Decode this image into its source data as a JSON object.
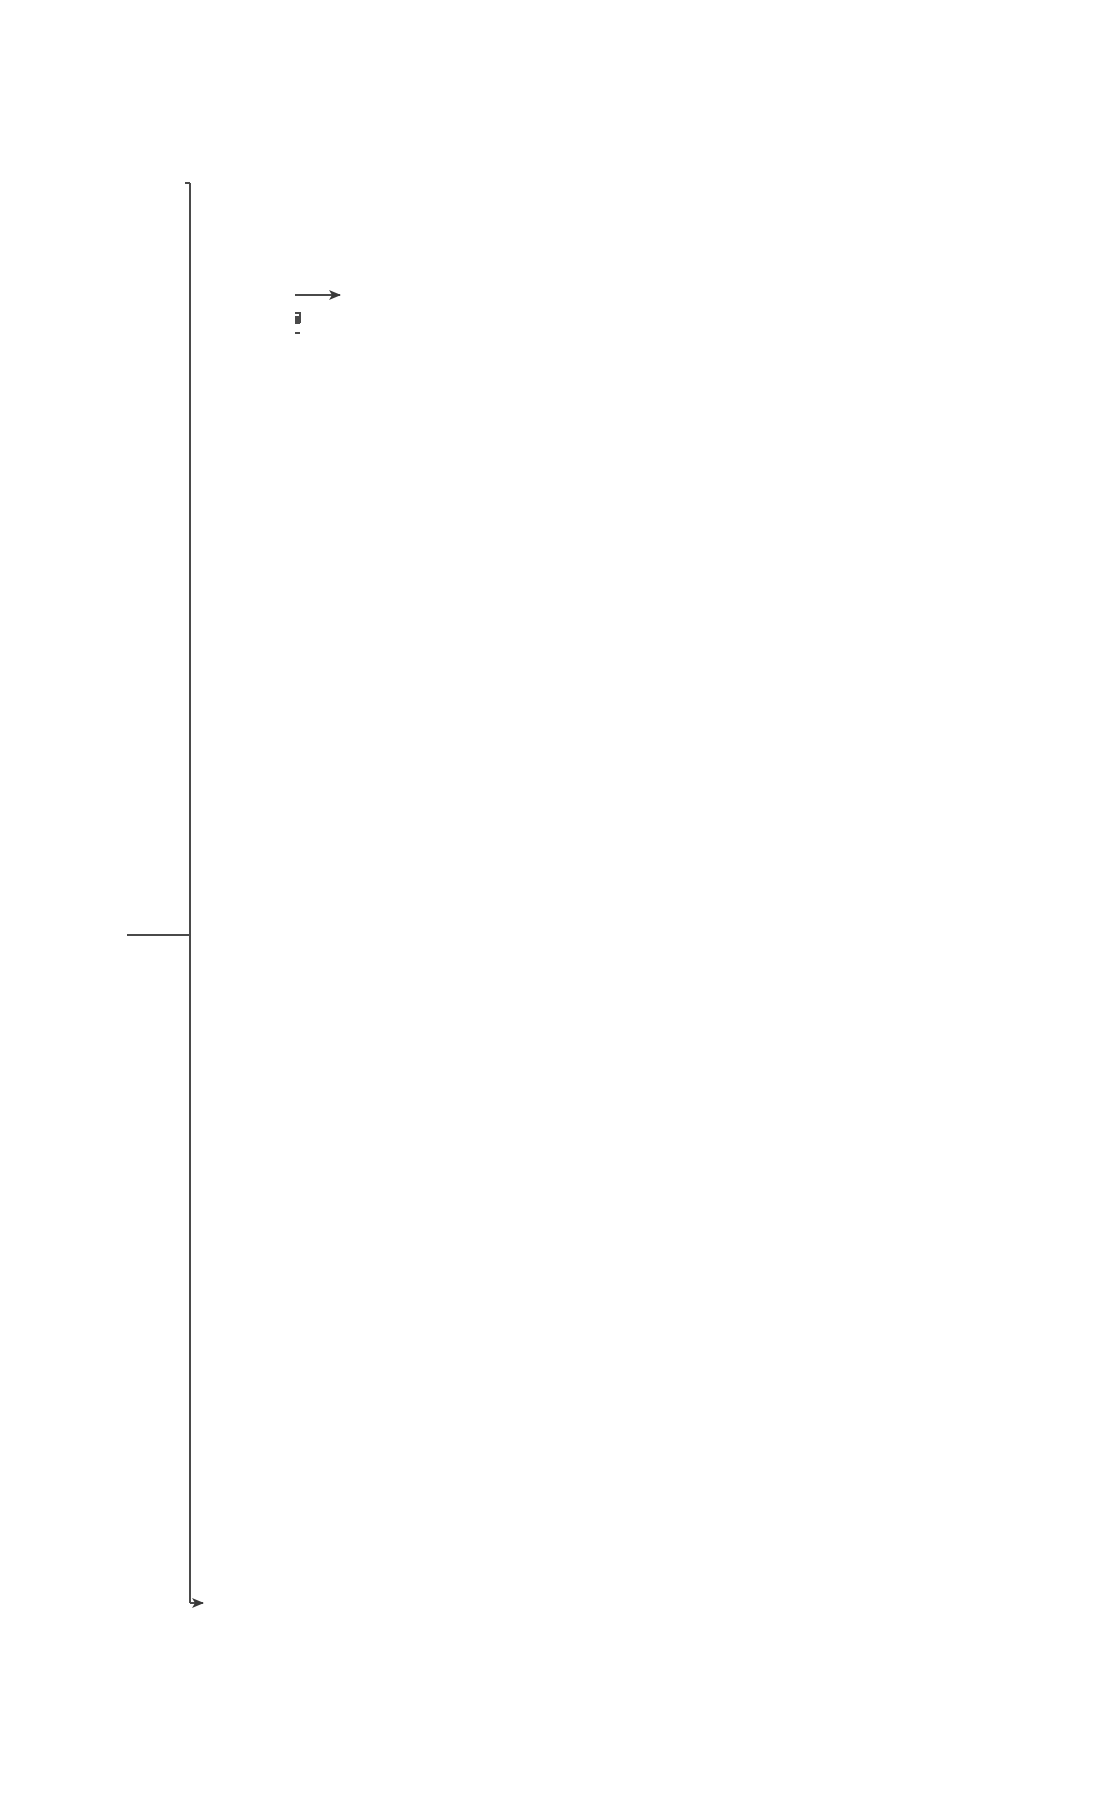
{
  "nodes": {
    "review": "Review clinical history, CBC-D trends, and peripheral blood smear",
    "all_ages_prefix": "All ages: Fever ",
    "all_ages_and": "and",
    "all_ages_suffix": " ANC <500/µL*",
    "supportive_history": "Supportive history",
    "supportive_micro": "Supportive history, microbiologic studies",
    "drug_related": "Drug-related neutropenia",
    "infection_related": "Infection-related neutropenia",
    "adults": "Adults",
    "infants_children": "Infants/Children",
    "other_cytopenias": "Other associated cytopenias?",
    "adult_findings": [
      "Cytopenias",
      "Splenomegaly",
      "Lymphadenopathy",
      "Joint swelling/bone pain",
      "Dysmorphia (abnormal growth and development; skin, hair, bone, nail changes)"
    ],
    "worrisome_heading": "Worrisome Hx, Signs, Symptoms?",
    "worrisome_items": [
      "Recurrences of infections that are severe, cyclic (every 21 days), or in unusual sites (e.g. periodontal, mucosal, perianal sores)",
      "Failure to thrive",
      "Chronic diarrhea",
      "Family history"
    ],
    "yes": "Yes",
    "no": "No",
    "poor_nutritional": "Poor nutritional status, autoimmune disease, others",
    "appropriate_ethnic": "Appropriate ethnic group",
    "normal_variant": "Normal variant with ANC <1500/µL (previously called benign ethnic neutropenia)",
    "autoimmune_disease": "(+) Autoimmune disease",
    "low_b12": "Low B12, folate, copper, etc",
    "secondary_autoimmune": "Secondary autoimmune neutropenia",
    "ddx_label": "DDx:",
    "ddx_nutritional": [
      "Nutritional deficiency-related",
      "Megaloblastic anemia",
      "Copper deficiency"
    ],
    "ddx_mds": [
      "MDS",
      "T-/NK-LGLL",
      "Primary AIMF",
      "Chronic idiopathic neutropenia"
    ],
    "serial_followup": "Serial follow-up of clinical features, CBC every 2 to 12 weeks",
    "cyclic": "Cyclic",
    "ddx_congenital": [
      "Congenital neutropenia",
      "(See Table 10-7)"
    ],
    "resolves": "Resolves within 1 month",
    "stable_improved": "Stable/Improved",
    "progressive": "Progressive changes, worsening, or persistence beyond 11 years of age",
    "ddx_isoimmune": [
      "Isoimmune neonatal neutropenia",
      "Infection-related neutropenia",
      "Transient idiopathic neutropenia"
    ],
    "ddx_primary_autoimmune": [
      "Primary autoimmune neutropenia",
      "Idiopathic neutropenia"
    ],
    "ddx_primary_immuno": [
      "Primary immunodeficiency (eg.CVID)",
      "Congenital neutropenia (Table 10-7)"
    ]
  },
  "caption": {
    "text_prefix": "...tial clinical approach and differential diagnosis for neutropenia for all age groups. ",
    "abbr": "ANC",
    "text_suffix": ", Absolute neutrophil count;"
  },
  "colors": {
    "box_fill": "#d9d9d9",
    "header_fill": "#8c8c8c",
    "border": "#5a5a5a",
    "line": "#4a4a4a"
  }
}
